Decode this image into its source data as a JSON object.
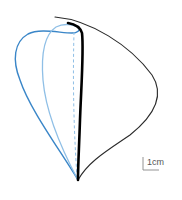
{
  "figure": {
    "type": "leaf/wing outline shape comparison diagram",
    "colors": {
      "outer_black": "#2a2a2a",
      "thick_black": "#000000",
      "dark_blue": "#3a86c8",
      "light_blue": "#8fbfe6",
      "dashed_blue": "#8fbfe6",
      "scale_bar": "#888888"
    },
    "curves": [
      {
        "name": "outer-thin-black-outline",
        "style": "solid thin"
      },
      {
        "name": "thick-black-outline",
        "style": "solid thick"
      },
      {
        "name": "dark-blue-outline",
        "style": "solid"
      },
      {
        "name": "light-blue-outline",
        "style": "solid"
      },
      {
        "name": "dashed-blue-midline",
        "style": "dashed"
      }
    ],
    "scale_bar": {
      "label": "1cm"
    }
  }
}
